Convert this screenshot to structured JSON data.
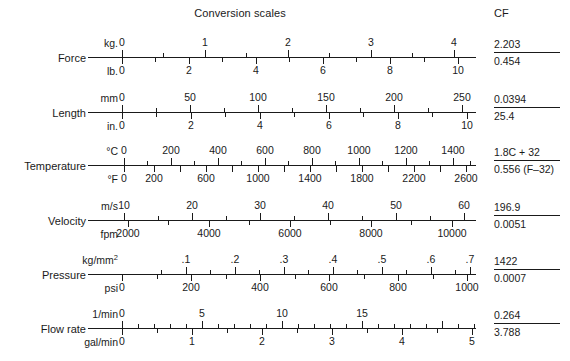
{
  "header": {
    "title": "Conversion scales",
    "cf_label": "CF"
  },
  "axis": {
    "x_start": 88,
    "x_end": 476
  },
  "chart_data": {
    "type": "table",
    "title": "Conversion scales",
    "rows": [
      {
        "quantity": "Force",
        "top": {
          "unit": "kg.",
          "labels": [
            "0",
            "1",
            "2",
            "3",
            "4"
          ],
          "label_x": [
            122,
            205,
            288,
            371,
            454
          ],
          "major_x": [
            122,
            205,
            288,
            371,
            454
          ],
          "minor_x": [
            163,
            246,
            329,
            412
          ]
        },
        "bottom": {
          "unit": "lb.",
          "labels": [
            "0",
            "2",
            "4",
            "6",
            "8",
            "10"
          ],
          "label_x": [
            122,
            189,
            256,
            323,
            390,
            458
          ],
          "major_x": [
            122,
            189,
            256,
            323,
            390,
            458
          ],
          "minor_x": [
            155,
            222,
            289,
            356,
            424
          ]
        },
        "cf_numerator": "2.203",
        "cf_denominator": "0.454"
      },
      {
        "quantity": "Length",
        "top": {
          "unit": "mm",
          "labels": [
            "0",
            "50",
            "100",
            "150",
            "200",
            "250"
          ],
          "label_x": [
            122,
            190,
            258,
            326,
            394,
            462
          ],
          "major_x": [
            122,
            190,
            258,
            326,
            394,
            462
          ],
          "minor_x": [
            156,
            224,
            292,
            360,
            428
          ]
        },
        "bottom": {
          "unit": "in.",
          "labels": [
            "0",
            "2",
            "4",
            "6",
            "8",
            "10"
          ],
          "label_x": [
            122,
            191,
            260,
            329,
            398,
            467
          ],
          "major_x": [
            122,
            191,
            260,
            329,
            398,
            467
          ],
          "minor_x": [
            156,
            225,
            294,
            363,
            432
          ]
        },
        "cf_numerator": "0.0394",
        "cf_denominator": "25.4"
      },
      {
        "quantity": "Temperature",
        "top": {
          "unit": "°C",
          "labels": [
            "0",
            "200",
            "400",
            "600",
            "800",
            "1000",
            "1200",
            "1400"
          ],
          "label_x": [
            124,
            171,
            218,
            265,
            312,
            359,
            406,
            453
          ],
          "major_x": [
            124,
            171,
            218,
            265,
            312,
            359,
            406,
            453
          ],
          "minor_x": [
            147,
            194,
            241,
            288,
            335,
            382,
            429,
            470
          ]
        },
        "bottom": {
          "unit": "°F",
          "labels": [
            "0",
            "200",
            "600",
            "1000",
            "1400",
            "1800",
            "2200",
            "2600"
          ],
          "label_x": [
            124,
            154,
            206,
            258,
            310,
            362,
            414,
            466
          ],
          "major_x": [
            124,
            154,
            180,
            206,
            232,
            258,
            284,
            310,
            336,
            362,
            388,
            414,
            440,
            466
          ],
          "minor_x": []
        },
        "cf_numerator": "1.8C + 32",
        "cf_denominator": "0.556 (F–32)"
      },
      {
        "quantity": "Velocity",
        "top": {
          "unit": "m/s",
          "labels": [
            "10",
            "20",
            "30",
            "40",
            "50",
            "60"
          ],
          "label_x": [
            124,
            192,
            260,
            328,
            396,
            464
          ],
          "major_x": [
            124,
            192,
            260,
            328,
            396,
            464
          ],
          "minor_x": [
            158,
            226,
            294,
            362,
            430
          ]
        },
        "bottom": {
          "unit": "fpm",
          "labels": [
            "2000",
            "4000",
            "6000",
            "8000",
            "10000"
          ],
          "label_x": [
            128,
            209,
            290,
            371,
            452
          ],
          "major_x": [
            128,
            209,
            290,
            371,
            452
          ],
          "minor_x": [
            168,
            249,
            330,
            411
          ]
        },
        "cf_numerator": "196.9",
        "cf_denominator": "0.0051"
      },
      {
        "quantity": "Pressure",
        "top": {
          "unit": "kg/mm²",
          "labels": [
            ".1",
            ".2",
            ".3",
            ".4",
            ".5",
            ".6",
            ".7"
          ],
          "label_x": [
            186,
            235,
            284,
            333,
            382,
            431,
            470
          ],
          "major_x": [
            186,
            235,
            284,
            333,
            382,
            431,
            470
          ],
          "minor_x": [
            161,
            210,
            259,
            308,
            357,
            406,
            455
          ]
        },
        "bottom": {
          "unit": "psi",
          "labels": [
            "0",
            "200",
            "400",
            "600",
            "800",
            "1000"
          ],
          "label_x": [
            122,
            191,
            260,
            329,
            398,
            467
          ],
          "major_x": [
            122,
            191,
            260,
            329,
            398,
            467
          ],
          "minor_x": [
            157,
            226,
            295,
            364,
            433
          ]
        },
        "cf_numerator": "1422",
        "cf_denominator": "0.0007"
      },
      {
        "quantity": "Flow rate",
        "top": {
          "unit": "1/min",
          "labels": [
            "0",
            "5",
            "10",
            "15"
          ],
          "label_x": [
            122,
            202,
            282,
            362
          ],
          "major_x": [
            122,
            202,
            282,
            362,
            442
          ],
          "minor_x": [
            138,
            154,
            170,
            186,
            218,
            234,
            250,
            266,
            298,
            314,
            330,
            346,
            378,
            394,
            410,
            426,
            458,
            474
          ]
        },
        "bottom": {
          "unit": "gal/min",
          "labels": [
            "0",
            "1",
            "2",
            "3",
            "4",
            "5"
          ],
          "label_x": [
            122,
            192,
            262,
            332,
            402,
            472
          ],
          "major_x": [
            122,
            192,
            262,
            332,
            402,
            472
          ],
          "minor_x": [
            157,
            227,
            297,
            367,
            437
          ]
        },
        "cf_numerator": "0.264",
        "cf_denominator": "3.788"
      }
    ]
  }
}
